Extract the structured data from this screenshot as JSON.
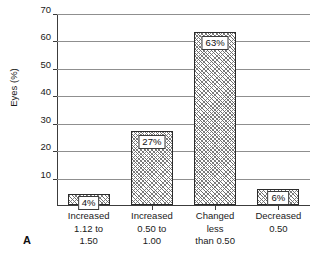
{
  "chart_data": {
    "type": "bar",
    "title": "",
    "xlabel": "",
    "ylabel": "Eyes (%)",
    "ylim": [
      0,
      70
    ],
    "yticks": [
      0,
      10,
      20,
      30,
      40,
      50,
      60,
      70
    ],
    "ytick_labels": [
      "",
      "10",
      "20",
      "30",
      "40",
      "50",
      "60",
      "70"
    ],
    "grid": "horizontal",
    "legend": "none",
    "categories": [
      "Increased 1.12 to 1.50",
      "Increased 0.50 to 1.00",
      "Changed less than 0.50",
      "Decreased 0.50"
    ],
    "category_lines": [
      [
        "Increased",
        "1.12 to",
        "1.50"
      ],
      [
        "Increased",
        "0.50 to",
        "1.00"
      ],
      [
        "Changed",
        "less",
        "than 0.50"
      ],
      [
        "Decreased",
        "0.50",
        ""
      ]
    ],
    "values": [
      4,
      27,
      63,
      6
    ],
    "data_labels": [
      "4%",
      "27%",
      "63%",
      "6%"
    ],
    "bar_fill": "diagonal-crosshatch",
    "bar_edge_color": "#2b2b2b"
  },
  "panel": {
    "letter": "A"
  }
}
